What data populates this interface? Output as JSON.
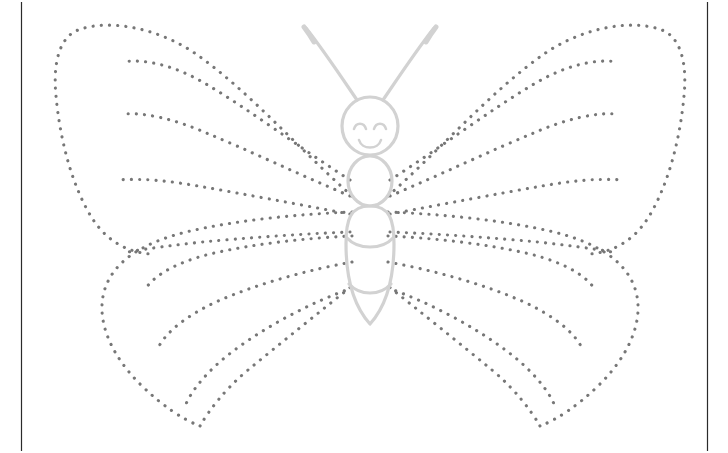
{
  "worksheet": {
    "kind": "dot-tracing-worksheet",
    "subject": "butterfly",
    "background_color": "#ffffff",
    "dot_color": "#777777",
    "body_line_color": "#d2d2d2",
    "frame_color": "#2b2b2b",
    "canvas": {
      "width": 728,
      "height": 453
    },
    "frame": {
      "left_rule_x": 21,
      "right_rule_x": 707,
      "top_y": 2,
      "bottom_y": 451,
      "has_top_rule": false,
      "has_bottom_rule": false
    },
    "dot_style": {
      "dot_diameter": 3.1,
      "dot_spacing": 8.2,
      "linecap": "round"
    },
    "figure": {
      "center_x": 370,
      "wingspan_left_x": 55,
      "wingspan_right_x": 697,
      "top_y": 18,
      "bottom_y": 428
    },
    "parts": [
      {
        "name": "left-upper-wing-outline",
        "dotted": true
      },
      {
        "name": "right-upper-wing-outline",
        "dotted": true
      },
      {
        "name": "left-lower-wing-outline",
        "dotted": true
      },
      {
        "name": "right-lower-wing-outline",
        "dotted": true
      },
      {
        "name": "left-upper-wing-veins",
        "dotted": true,
        "count": 4
      },
      {
        "name": "right-upper-wing-veins",
        "dotted": true,
        "count": 4
      },
      {
        "name": "left-lower-wing-veins",
        "dotted": true,
        "count": 3
      },
      {
        "name": "right-lower-wing-veins",
        "dotted": true,
        "count": 3
      },
      {
        "name": "head",
        "dotted": false
      },
      {
        "name": "thorax",
        "dotted": false
      },
      {
        "name": "abdomen",
        "dotted": false
      },
      {
        "name": "left-antenna",
        "dotted": false
      },
      {
        "name": "right-antenna",
        "dotted": false
      },
      {
        "name": "left-eye",
        "dotted": false
      },
      {
        "name": "right-eye",
        "dotted": false
      },
      {
        "name": "smile",
        "dotted": false
      }
    ]
  }
}
